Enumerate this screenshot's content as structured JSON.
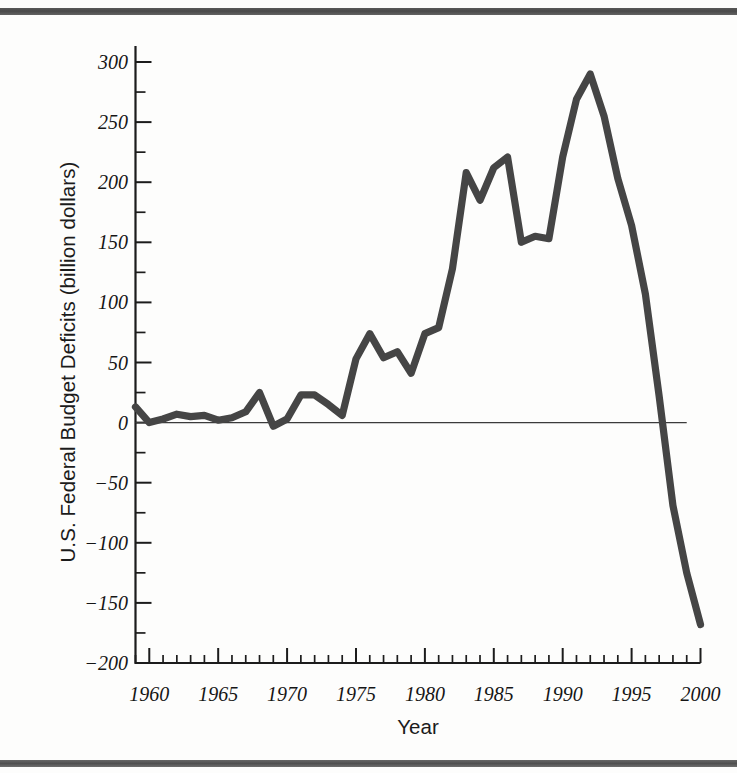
{
  "figure": {
    "xlabel": "Year",
    "ylabel": "U.S. Federal Budget Deficits (billion dollars)",
    "line_color": "#454545",
    "axis_color": "#1c1c1c"
  },
  "chart_data": {
    "type": "line",
    "title": "",
    "xlabel": "Year",
    "ylabel": "U.S. Federal Budget Deficits (billion dollars)",
    "xlim": [
      1959,
      2000
    ],
    "ylim": [
      -200,
      300
    ],
    "xticks": [
      1960,
      1965,
      1970,
      1975,
      1980,
      1985,
      1990,
      1995,
      2000
    ],
    "xtick_labels": [
      "1960",
      "1965",
      "1970",
      "1975",
      "1980",
      "1985",
      "1990",
      "1995",
      "2000"
    ],
    "x_minor_tick_step": 1,
    "yticks": [
      -200,
      -150,
      -100,
      -50,
      0,
      50,
      100,
      150,
      200,
      250,
      300
    ],
    "ytick_labels": [
      "−200",
      "−150",
      "−100",
      "−50",
      "0",
      "50",
      "100",
      "150",
      "200",
      "250",
      "300"
    ],
    "y_minor_tick_step": 25,
    "grid": false,
    "legend": null,
    "zero_reference_line": 0,
    "x": [
      1959,
      1960,
      1961,
      1962,
      1963,
      1964,
      1965,
      1966,
      1967,
      1968,
      1969,
      1970,
      1971,
      1972,
      1973,
      1974,
      1975,
      1976,
      1977,
      1978,
      1979,
      1980,
      1981,
      1982,
      1983,
      1984,
      1985,
      1986,
      1987,
      1988,
      1989,
      1990,
      1991,
      1992,
      1993,
      1994,
      1995,
      1996,
      1997,
      1998,
      1999,
      2000
    ],
    "values": [
      13,
      0,
      3,
      7,
      5,
      6,
      2,
      4,
      9,
      25,
      -3,
      3,
      23,
      23,
      15,
      6,
      53,
      74,
      54,
      59,
      41,
      74,
      79,
      128,
      208,
      185,
      212,
      221,
      150,
      155,
      153,
      221,
      269,
      290,
      255,
      203,
      164,
      107,
      22,
      -69,
      -125,
      -168
    ]
  }
}
